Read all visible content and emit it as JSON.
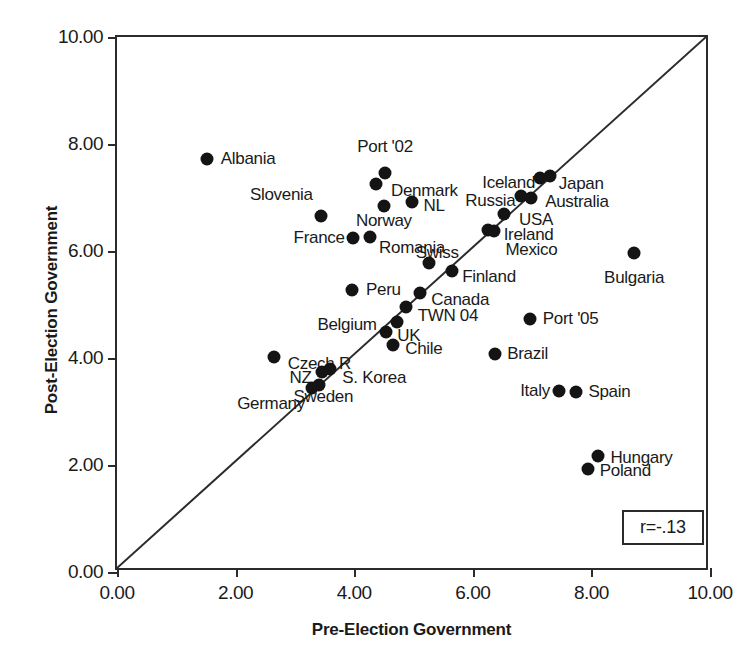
{
  "chart_data": {
    "type": "scatter",
    "title": "",
    "xlabel": "Pre-Election Government",
    "ylabel": "Post-Election Government",
    "xlim": [
      0,
      10
    ],
    "ylim": [
      0,
      10
    ],
    "xticks": [
      "0.00",
      "2.00",
      "4.00",
      "6.00",
      "8.00",
      "10.00"
    ],
    "yticks": [
      "0.00",
      "2.00",
      "4.00",
      "6.00",
      "8.00",
      "10.00"
    ],
    "xtick_values": [
      0,
      2,
      4,
      6,
      8,
      10
    ],
    "ytick_values": [
      0,
      2,
      4,
      6,
      8,
      10
    ],
    "grid": false,
    "legend": "none",
    "annotation": "r=-.13",
    "reference_line": {
      "type": "identity",
      "from": [
        0,
        0
      ],
      "to": [
        10,
        10
      ]
    },
    "points": [
      {
        "label": "Albania",
        "x": 1.52,
        "y": 7.72,
        "lx": 1.75,
        "ly": 7.72,
        "align": "r"
      },
      {
        "label": "Port '02",
        "x": 4.52,
        "y": 7.45,
        "lx": 4.52,
        "ly": 7.95,
        "align": "c"
      },
      {
        "label": "Denmark",
        "x": 4.37,
        "y": 7.26,
        "lx": 4.62,
        "ly": 7.13,
        "align": "r"
      },
      {
        "label": "Slovenia",
        "x": 3.44,
        "y": 6.66,
        "lx": 3.3,
        "ly": 7.05,
        "align": "l"
      },
      {
        "label": "NL",
        "x": 4.97,
        "y": 6.92,
        "lx": 5.17,
        "ly": 6.84,
        "align": "r"
      },
      {
        "label": "Norway",
        "x": 4.5,
        "y": 6.85,
        "lx": 4.5,
        "ly": 6.56,
        "align": "c"
      },
      {
        "label": "Iceland",
        "x": 7.13,
        "y": 7.37,
        "lx": 7.05,
        "ly": 7.27,
        "align": "l"
      },
      {
        "label": "Japan",
        "x": 7.3,
        "y": 7.41,
        "lx": 7.45,
        "ly": 7.25,
        "align": "r"
      },
      {
        "label": "Russia",
        "x": 6.82,
        "y": 7.03,
        "lx": 6.72,
        "ly": 6.93,
        "align": "l"
      },
      {
        "label": "Australia",
        "x": 6.98,
        "y": 7.0,
        "lx": 7.22,
        "ly": 6.92,
        "align": "r"
      },
      {
        "label": "USA",
        "x": 6.52,
        "y": 6.7,
        "lx": 6.78,
        "ly": 6.58,
        "align": "r"
      },
      {
        "label": "Ireland",
        "x": 6.26,
        "y": 6.4,
        "lx": 6.52,
        "ly": 6.3,
        "align": "r"
      },
      {
        "label": "Mexico",
        "x": 6.36,
        "y": 6.38,
        "lx": 6.55,
        "ly": 6.02,
        "align": "r"
      },
      {
        "label": "France",
        "x": 3.98,
        "y": 6.24,
        "lx": 3.84,
        "ly": 6.24,
        "align": "l"
      },
      {
        "label": "Romania",
        "x": 4.27,
        "y": 6.27,
        "lx": 4.42,
        "ly": 6.05,
        "align": "r"
      },
      {
        "label": "Bulgaria",
        "x": 8.72,
        "y": 5.96,
        "lx": 8.72,
        "ly": 5.5,
        "align": "c"
      },
      {
        "label": "Swiss",
        "x": 5.26,
        "y": 5.77,
        "lx": 5.4,
        "ly": 5.96,
        "align": "c"
      },
      {
        "label": "Finland",
        "x": 5.65,
        "y": 5.62,
        "lx": 5.82,
        "ly": 5.51,
        "align": "r"
      },
      {
        "label": "Peru",
        "x": 3.96,
        "y": 5.28,
        "lx": 4.2,
        "ly": 5.28,
        "align": "r"
      },
      {
        "label": "Canada",
        "x": 5.11,
        "y": 5.22,
        "lx": 5.3,
        "ly": 5.08,
        "align": "r"
      },
      {
        "label": "TWN 04",
        "x": 4.87,
        "y": 4.95,
        "lx": 5.07,
        "ly": 4.79,
        "align": "r"
      },
      {
        "label": "Port '05",
        "x": 6.96,
        "y": 4.73,
        "lx": 7.18,
        "ly": 4.73,
        "align": "r"
      },
      {
        "label": "Belgium",
        "x": 4.54,
        "y": 4.48,
        "lx": 4.38,
        "ly": 4.62,
        "align": "l"
      },
      {
        "label": "UK",
        "x": 4.72,
        "y": 4.68,
        "lx": 4.92,
        "ly": 4.42,
        "align": "c"
      },
      {
        "label": "Chile",
        "x": 4.66,
        "y": 4.24,
        "lx": 4.86,
        "ly": 4.16,
        "align": "r"
      },
      {
        "label": "Brazil",
        "x": 6.37,
        "y": 4.08,
        "lx": 6.58,
        "ly": 4.08,
        "align": "r"
      },
      {
        "label": "Czech R",
        "x": 2.65,
        "y": 4.02,
        "lx": 2.88,
        "ly": 3.88,
        "align": "r"
      },
      {
        "label": "S. Korea",
        "x": 3.6,
        "y": 3.8,
        "lx": 3.8,
        "ly": 3.62,
        "align": "r"
      },
      {
        "label": "NZ",
        "x": 3.46,
        "y": 3.74,
        "lx": 3.28,
        "ly": 3.62,
        "align": "l"
      },
      {
        "label": "Sweden",
        "x": 3.4,
        "y": 3.5,
        "lx": 3.48,
        "ly": 3.28,
        "align": "c"
      },
      {
        "label": "Germany",
        "x": 3.29,
        "y": 3.43,
        "lx": 3.17,
        "ly": 3.14,
        "align": "l"
      },
      {
        "label": "Italy",
        "x": 7.45,
        "y": 3.38,
        "lx": 7.3,
        "ly": 3.38,
        "align": "l"
      },
      {
        "label": "Spain",
        "x": 7.74,
        "y": 3.36,
        "lx": 7.95,
        "ly": 3.36,
        "align": "r"
      },
      {
        "label": "Hungary",
        "x": 8.11,
        "y": 2.16,
        "lx": 8.32,
        "ly": 2.14,
        "align": "r"
      },
      {
        "label": "Poland",
        "x": 7.94,
        "y": 1.92,
        "lx": 8.14,
        "ly": 1.88,
        "align": "r"
      }
    ]
  }
}
